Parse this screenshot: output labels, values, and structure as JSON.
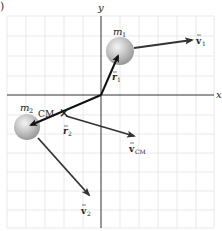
{
  "figure": {
    "part_label": ")",
    "axes": {
      "x_label": "x",
      "y_label": "y",
      "origin_px": [
        101,
        95
      ]
    },
    "grid": {
      "x_start": 7,
      "x_end": 214,
      "y_start": 16,
      "y_end": 228,
      "spacing": 19,
      "color": "#e3e3e3"
    },
    "masses": [
      {
        "id": "m1",
        "label": "m",
        "subscript": "1",
        "center": [
          120,
          51
        ],
        "radius": 14
      },
      {
        "id": "m2",
        "label": "m",
        "subscript": "2",
        "center": [
          27,
          127
        ],
        "radius": 13
      }
    ],
    "center_of_mass": {
      "label": "CM",
      "marker": "×",
      "position": [
        64,
        113
      ]
    },
    "vectors": [
      {
        "id": "r1",
        "label": "r",
        "subscript": "1",
        "from": [
          101,
          95
        ],
        "to": [
          120,
          54
        ],
        "color": "#111111"
      },
      {
        "id": "r2",
        "label": "r",
        "subscript": "2",
        "from": [
          101,
          95
        ],
        "to": [
          29,
          126
        ],
        "color": "#111111"
      },
      {
        "id": "v1",
        "label": "v",
        "subscript": "1",
        "from": [
          134,
          48
        ],
        "to": [
          194,
          39
        ],
        "color": "#333333"
      },
      {
        "id": "v2",
        "label": "v",
        "subscript": "2",
        "from": [
          38,
          138
        ],
        "to": [
          91,
          197
        ],
        "color": "#333333"
      },
      {
        "id": "vCM",
        "label": "v",
        "subscript": "CM",
        "from": [
          66,
          116
        ],
        "to": [
          136,
          137
        ],
        "color": "#333333"
      }
    ],
    "colors": {
      "axis": "#333333",
      "sphere_fill": "#b8b8b8",
      "sphere_highlight": "#f2f2f2",
      "text": "#222222"
    }
  }
}
